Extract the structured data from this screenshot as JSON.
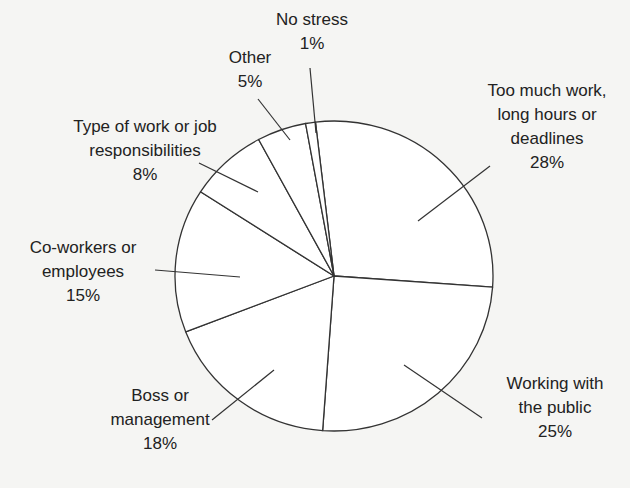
{
  "chart_data": {
    "type": "pie",
    "title": "",
    "start_angle_deg": -6.7,
    "direction": "clockwise",
    "slices": [
      {
        "label": "Too much work, long hours or deadlines",
        "value": 28,
        "display": "Too much work,\nlong hours or\ndeadlines\n28%"
      },
      {
        "label": "Working with the public",
        "value": 25,
        "display": "Working with\nthe public\n25%"
      },
      {
        "label": "Boss or management",
        "value": 18,
        "display": "Boss or\nmanagement\n18%"
      },
      {
        "label": "Co-workers or employees",
        "value": 15,
        "display": "Co-workers or\nemployees\n15%"
      },
      {
        "label": "Type of work or job responsibilities",
        "value": 8,
        "display": "Type of work or job\nresponsibilities\n8%"
      },
      {
        "label": "Other",
        "value": 5,
        "display": "Other\n5%"
      },
      {
        "label": "No stress",
        "value": 1,
        "display": "No stress\n1%"
      }
    ],
    "colors": {
      "fill": "#ffffff",
      "stroke": "#333333"
    }
  }
}
